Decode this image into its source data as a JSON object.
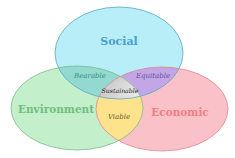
{
  "diagram": {
    "type": "venn",
    "sets": [
      {
        "id": "social",
        "label": "Social",
        "fill": "#b7eef7",
        "stroke": "#5aa8c0",
        "text_color": "#4aa0c8"
      },
      {
        "id": "environment",
        "label": "Environment",
        "fill": "#c4efcb",
        "stroke": "#7cba8a",
        "text_color": "#6fbf7f"
      },
      {
        "id": "economic",
        "label": "Economic",
        "fill": "#fac1c8",
        "stroke": "#e08892",
        "text_color": "#f07f80"
      }
    ],
    "intersections": [
      {
        "sets": [
          "social",
          "environment"
        ],
        "label": "Bearable",
        "fill": "#92d9d0",
        "text_color": "#3f8f80"
      },
      {
        "sets": [
          "social",
          "economic"
        ],
        "label": "Equitable",
        "fill": "#c2a6e6",
        "text_color": "#6a52a0"
      },
      {
        "sets": [
          "environment",
          "economic"
        ],
        "label": "Viable",
        "fill": "#fde48c",
        "text_color": "#6a5a2a"
      },
      {
        "sets": [
          "social",
          "environment",
          "economic"
        ],
        "label": "Sustainable",
        "fill": "#dcdcdc",
        "text_color": "#222222"
      }
    ]
  }
}
